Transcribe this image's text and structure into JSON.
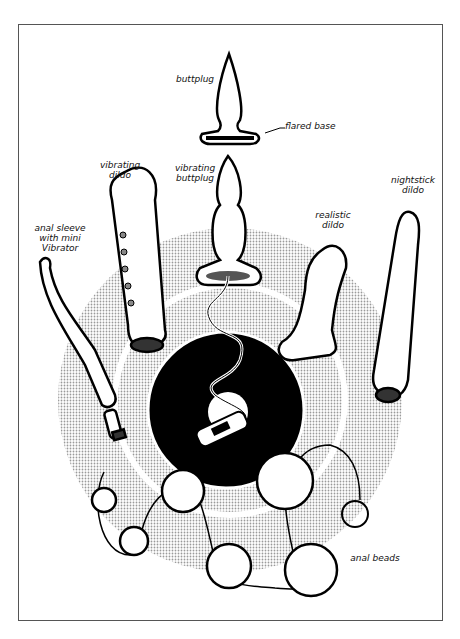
{
  "figure": {
    "labels": {
      "buttplug": "buttplug",
      "flared_base": "flared base",
      "vibrating_dildo": "vibrating dildo",
      "vibrating_buttplug": "vibrating buttplug",
      "nightstick_dildo": "nightstick dildo",
      "realistic_dildo": "realistic dildo",
      "anal_sleeve": "anal sleeve with mini Vibrator",
      "anal_beads": "anal beads"
    }
  }
}
